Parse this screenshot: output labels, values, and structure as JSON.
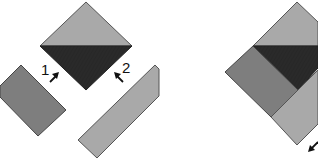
{
  "diagram": {
    "type": "quilt-block-assembly",
    "colors": {
      "light": "#a9a9a9",
      "medium": "#7e7e7e",
      "dark": "#2a2a2a",
      "outline": "#4a4a4a",
      "arrow": "#111111"
    },
    "step_labels": [
      {
        "id": "1",
        "text": "1"
      },
      {
        "id": "2",
        "text": "2"
      }
    ],
    "left_panel": {
      "pieces": [
        {
          "name": "center-square-top-half",
          "color": "light"
        },
        {
          "name": "center-square-bottom-half",
          "color": "dark"
        },
        {
          "name": "strip-1",
          "color": "medium"
        },
        {
          "name": "strip-2",
          "color": "light"
        }
      ]
    },
    "right_panel": {
      "pieces": [
        {
          "name": "assembled-top-triangle",
          "color": "light"
        },
        {
          "name": "assembled-dark-triangle",
          "color": "dark"
        },
        {
          "name": "assembled-strip-1",
          "color": "medium"
        },
        {
          "name": "assembled-strip-2",
          "color": "light"
        }
      ]
    }
  }
}
